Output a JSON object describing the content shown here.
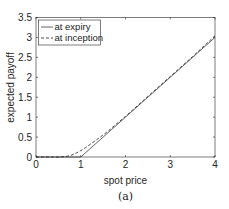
{
  "chart_data": {
    "type": "line",
    "title": "",
    "caption": "(a)",
    "xlabel": "spot price",
    "ylabel": "expected payoff",
    "xlim": [
      0,
      4
    ],
    "ylim": [
      0,
      3.5
    ],
    "xticks": [
      "0",
      "1",
      "2",
      "3",
      "4"
    ],
    "yticks": [
      "0",
      "0.5",
      "1",
      "1.5",
      "2",
      "2.5",
      "3",
      "3.5"
    ],
    "grid": false,
    "legend_position": "upper left",
    "series": [
      {
        "name": "at expiry",
        "style": "solid",
        "x": [
          0,
          0.5,
          1.0,
          1.5,
          2.0,
          2.5,
          3.0,
          3.5,
          4.0
        ],
        "y": [
          0,
          0,
          0,
          0.5,
          1.0,
          1.5,
          2.0,
          2.5,
          3.0
        ]
      },
      {
        "name": "at inception",
        "style": "dashed",
        "x": [
          0,
          0.5,
          0.6,
          0.7,
          0.8,
          0.9,
          1.0,
          1.1,
          1.2,
          1.4,
          1.6,
          2.0,
          2.5,
          3.0,
          3.5,
          4.0
        ],
        "y": [
          0,
          0,
          0.005,
          0.02,
          0.05,
          0.1,
          0.16,
          0.23,
          0.31,
          0.47,
          0.64,
          1.02,
          1.52,
          2.02,
          2.52,
          3.04
        ]
      }
    ]
  }
}
